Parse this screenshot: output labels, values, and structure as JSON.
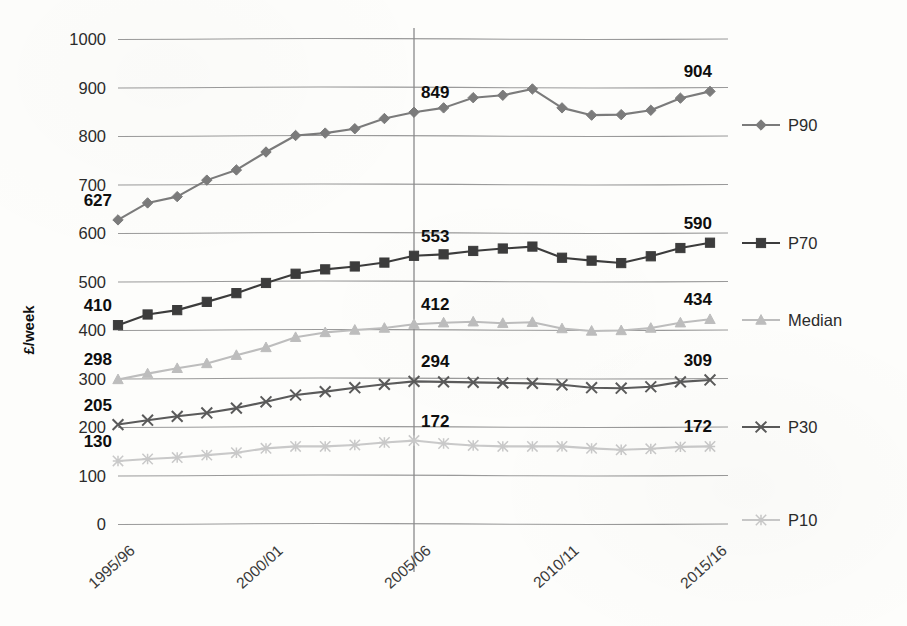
{
  "chart_data": {
    "type": "line",
    "title": "",
    "xlabel": "",
    "ylabel": "£/week",
    "ylim": [
      0,
      1000
    ],
    "ytick_step": 100,
    "grid": true,
    "legend_position": "right",
    "x": [
      "1995/96",
      "1996/97",
      "1997/98",
      "1998/99",
      "1999/00",
      "2000/01",
      "2001/02",
      "2002/03",
      "2003/04",
      "2004/05",
      "2005/06",
      "2006/07",
      "2007/08",
      "2008/09",
      "2009/10",
      "2010/11",
      "2011/12",
      "2012/13",
      "2013/14",
      "2014/15",
      "2015/16"
    ],
    "xtick_labels": [
      "1995/96",
      "2000/01",
      "2005/06",
      "2010/11",
      "2015/16"
    ],
    "xtick_indices": [
      0,
      5,
      10,
      15,
      20
    ],
    "ytick_labels": [
      "0",
      "100",
      "200",
      "300",
      "400",
      "500",
      "600",
      "700",
      "800",
      "900",
      "1000"
    ],
    "ytick_values": [
      0,
      100,
      200,
      300,
      400,
      500,
      600,
      700,
      800,
      900,
      1000
    ],
    "reference_line_x": "2005/06",
    "series": [
      {
        "name": "P90",
        "color": "#7b7b7b",
        "marker": "diamond",
        "values": [
          627,
          662,
          675,
          709,
          730,
          767,
          801,
          806,
          815,
          836,
          849,
          858,
          879,
          884,
          897,
          858,
          843,
          844,
          853,
          878,
          892
        ],
        "labels": [
          {
            "index": 0,
            "text": "627"
          },
          {
            "index": 10,
            "text": "849"
          },
          {
            "index": 20,
            "text": "904"
          }
        ]
      },
      {
        "name": "P70",
        "color": "#3c3c3c",
        "marker": "square",
        "values": [
          410,
          432,
          441,
          458,
          476,
          497,
          516,
          525,
          531,
          539,
          553,
          556,
          563,
          568,
          572,
          549,
          543,
          538,
          552,
          569,
          580
        ],
        "labels": [
          {
            "index": 0,
            "text": "410"
          },
          {
            "index": 10,
            "text": "553"
          },
          {
            "index": 20,
            "text": "590"
          }
        ]
      },
      {
        "name": "Median",
        "color": "#bdbdbd",
        "marker": "triangle",
        "values": [
          298,
          310,
          321,
          331,
          348,
          364,
          385,
          395,
          400,
          404,
          412,
          415,
          417,
          414,
          416,
          403,
          398,
          399,
          404,
          415,
          422
        ],
        "labels": [
          {
            "index": 0,
            "text": "298"
          },
          {
            "index": 10,
            "text": "412"
          },
          {
            "index": 20,
            "text": "434"
          }
        ]
      },
      {
        "name": "P30",
        "color": "#5a5a5a",
        "marker": "cross",
        "values": [
          205,
          214,
          222,
          229,
          239,
          252,
          266,
          273,
          281,
          288,
          294,
          293,
          292,
          291,
          290,
          287,
          281,
          280,
          283,
          293,
          297
        ],
        "labels": [
          {
            "index": 0,
            "text": "205"
          },
          {
            "index": 10,
            "text": "294"
          },
          {
            "index": 20,
            "text": "309"
          }
        ]
      },
      {
        "name": "P10",
        "color": "#c9c9c9",
        "marker": "asterisk",
        "values": [
          130,
          134,
          137,
          142,
          147,
          156,
          160,
          160,
          163,
          168,
          172,
          166,
          162,
          160,
          160,
          160,
          156,
          153,
          155,
          159,
          160
        ],
        "labels": [
          {
            "index": 0,
            "text": "130"
          },
          {
            "index": 10,
            "text": "172"
          },
          {
            "index": 20,
            "text": "172"
          }
        ]
      }
    ],
    "edge_labels": {
      "left": [
        "627",
        "410",
        "298",
        "205",
        "130"
      ],
      "middle": [
        "849",
        "553",
        "412",
        "294",
        "172"
      ],
      "right": [
        "904",
        "590",
        "434",
        "309",
        "172"
      ]
    }
  },
  "legend": {
    "items": [
      {
        "label": "P90"
      },
      {
        "label": "P70"
      },
      {
        "label": "Median"
      },
      {
        "label": "P30"
      },
      {
        "label": "P10"
      }
    ]
  },
  "colors": {
    "gridline": "#9a9a9a",
    "reference_line": "#8a8a8a",
    "background": "#fdfdfb",
    "text": "#1a1a1a"
  }
}
